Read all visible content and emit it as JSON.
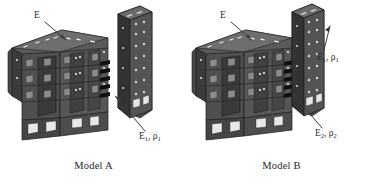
{
  "figure": {
    "background_color": "#ffffff",
    "ink_color": "#2b2b2b",
    "structure_fill_dark": "#3a3a3a",
    "structure_fill_mid": "#565656",
    "structure_fill_light": "#6e6e6e",
    "structure_edge": "#1e1e1e"
  },
  "panels": [
    {
      "id": "model-a",
      "caption": "Model A",
      "annotations": [
        {
          "name": "modulus-label-e",
          "text_main": "E",
          "sub": "",
          "second_main": "",
          "second_sub": ""
        },
        {
          "name": "modulus-label-e1r1",
          "text_main": "E",
          "sub": "1",
          "second_main": "ρ",
          "second_sub": "1"
        }
      ]
    },
    {
      "id": "model-b",
      "caption": "Model B",
      "annotations": [
        {
          "name": "modulus-label-e",
          "text_main": "E",
          "sub": "",
          "second_main": "",
          "second_sub": ""
        },
        {
          "name": "modulus-label-e1r1",
          "text_main": "E",
          "sub": "1",
          "second_main": "ρ",
          "second_sub": "1"
        },
        {
          "name": "modulus-label-e2r2",
          "text_main": "E",
          "sub": "2",
          "second_main": "ρ",
          "second_sub": "2"
        }
      ]
    }
  ],
  "labels": {
    "e": "E",
    "e_sub1": "1",
    "e_sub2": "2",
    "rho": "ρ",
    "rho_sub1": "1",
    "rho_sub2": "2",
    "comma": ",",
    "caption_a": "Model A",
    "caption_b": "Model B"
  }
}
